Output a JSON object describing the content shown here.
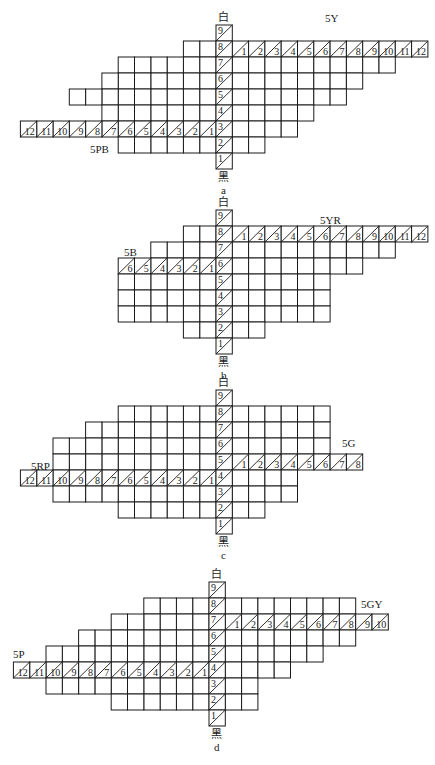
{
  "figure": {
    "cell_w": 16.3,
    "cell_h": 16,
    "diagrams": [
      {
        "id": "a",
        "letter": "a",
        "center_x": 216,
        "top_y": 25,
        "white_label": "白",
        "black_label": "黑",
        "right_hue": {
          "name": "5Y",
          "row": 8,
          "count": 12,
          "label_x": 325,
          "label_y": 12
        },
        "left_hue": {
          "name": "5PB",
          "row": 3,
          "count": 12,
          "label_x": 90,
          "label_y": 143
        },
        "rows": [
          {
            "value": 9,
            "left": 0,
            "right": 0
          },
          {
            "value": 8,
            "left": 2,
            "right": 12
          },
          {
            "value": 7,
            "left": 6,
            "right": 10
          },
          {
            "value": 6,
            "left": 7,
            "right": 8
          },
          {
            "value": 5,
            "left": 9,
            "right": 7
          },
          {
            "value": 4,
            "left": 7,
            "right": 5
          },
          {
            "value": 3,
            "left": 12,
            "right": 4
          },
          {
            "value": 2,
            "left": 6,
            "right": 2
          },
          {
            "value": 1,
            "left": 0,
            "right": 0
          }
        ]
      },
      {
        "id": "b",
        "letter": "b",
        "center_x": 216,
        "top_y": 210,
        "white_label": "白",
        "black_label": "黑",
        "right_hue": {
          "name": "5YR",
          "row": 8,
          "count": 12,
          "label_x": 320,
          "label_y": 214
        },
        "left_hue": {
          "name": "5B",
          "row": 6,
          "count": 6,
          "label_x": 124,
          "label_y": 246
        },
        "rows": [
          {
            "value": 9,
            "left": 0,
            "right": 0
          },
          {
            "value": 8,
            "left": 2,
            "right": 12
          },
          {
            "value": 7,
            "left": 4,
            "right": 10
          },
          {
            "value": 6,
            "left": 6,
            "right": 8
          },
          {
            "value": 5,
            "left": 6,
            "right": 6
          },
          {
            "value": 4,
            "left": 6,
            "right": 6
          },
          {
            "value": 3,
            "left": 6,
            "right": 6
          },
          {
            "value": 2,
            "left": 2,
            "right": 2
          },
          {
            "value": 1,
            "left": 0,
            "right": 0
          }
        ]
      },
      {
        "id": "c",
        "letter": "c",
        "center_x": 216,
        "top_y": 390,
        "white_label": "白",
        "black_label": "黑",
        "right_hue": {
          "name": "5G",
          "row": 5,
          "count": 8,
          "label_x": 342,
          "label_y": 437
        },
        "left_hue": {
          "name": "5RP",
          "row": 4,
          "count": 12,
          "label_x": 31,
          "label_y": 460
        },
        "rows": [
          {
            "value": 9,
            "left": 0,
            "right": 0
          },
          {
            "value": 8,
            "left": 6,
            "right": 6
          },
          {
            "value": 7,
            "left": 8,
            "right": 6
          },
          {
            "value": 6,
            "left": 10,
            "right": 6
          },
          {
            "value": 5,
            "left": 10,
            "right": 8
          },
          {
            "value": 4,
            "left": 12,
            "right": 4
          },
          {
            "value": 3,
            "left": 10,
            "right": 4
          },
          {
            "value": 2,
            "left": 6,
            "right": 2
          },
          {
            "value": 1,
            "left": 0,
            "right": 0
          }
        ]
      },
      {
        "id": "d",
        "letter": "d",
        "center_x": 209,
        "top_y": 582,
        "white_label": "白",
        "black_label": "黑",
        "right_hue": {
          "name": "5GY",
          "row": 7,
          "count": 10,
          "label_x": 361,
          "label_y": 598
        },
        "left_hue": {
          "name": "5P",
          "row": 4,
          "count": 12,
          "label_x": 13,
          "label_y": 648
        },
        "rows": [
          {
            "value": 9,
            "left": 0,
            "right": 0
          },
          {
            "value": 8,
            "left": 4,
            "right": 8
          },
          {
            "value": 7,
            "left": 6,
            "right": 10
          },
          {
            "value": 6,
            "left": 8,
            "right": 8
          },
          {
            "value": 5,
            "left": 10,
            "right": 6
          },
          {
            "value": 4,
            "left": 12,
            "right": 4
          },
          {
            "value": 3,
            "left": 10,
            "right": 2
          },
          {
            "value": 2,
            "left": 6,
            "right": 2
          },
          {
            "value": 1,
            "left": 0,
            "right": 0
          }
        ]
      }
    ]
  }
}
